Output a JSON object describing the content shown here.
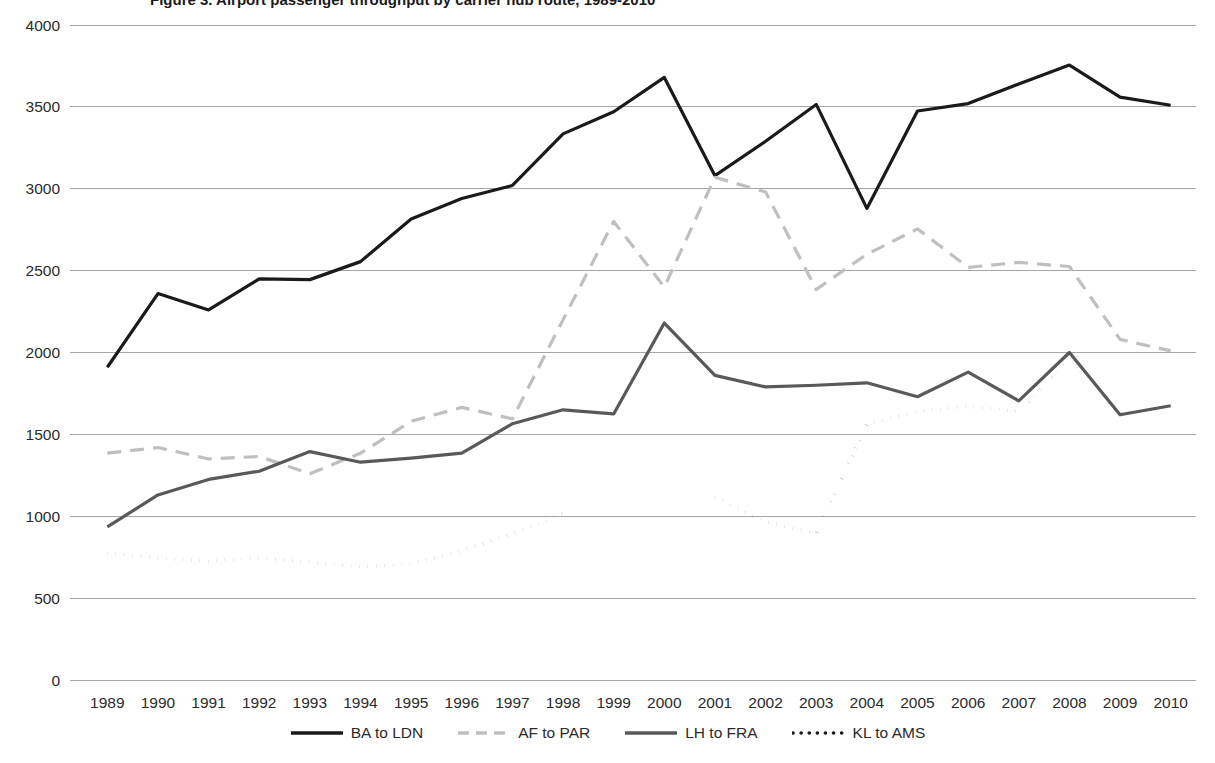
{
  "chart_title": "Figure 3. Airport passenger throughput by carrier hub route, 1989-2010",
  "legend": {
    "position": "bottom-center",
    "items": [
      {
        "label": "BA to LDN",
        "color": "#1a1a1a",
        "style": "solid",
        "width": 3.2,
        "swatch": "legend-swatch-solid-black"
      },
      {
        "label": "AF to PAR",
        "color": "#bfbfbf",
        "style": "dashed",
        "width": 3.2,
        "swatch": "legend-swatch-dashed-gray"
      },
      {
        "label": "LH to FRA",
        "color": "#595959",
        "style": "solid",
        "width": 3.2,
        "swatch": "legend-swatch-solid-gray"
      },
      {
        "label": "KL to AMS",
        "color": "#1a1a1a",
        "style": "dotted",
        "width": 3.4,
        "swatch": "legend-swatch-dotted-black"
      }
    ]
  },
  "axes": {
    "y_ticks": [
      "4000",
      "3500",
      "3000",
      "2500",
      "2000",
      "1500",
      "1000",
      "500",
      "0"
    ],
    "x_ticks": [
      "1989",
      "1990",
      "1991",
      "1992",
      "1993",
      "1994",
      "1995",
      "1996",
      "1997",
      "1998",
      "1999",
      "2000",
      "2001",
      "2002",
      "2003",
      "2004",
      "2005",
      "2006",
      "2007",
      "2008",
      "2009",
      "2010"
    ]
  },
  "chart_data": {
    "type": "line",
    "title": "Figure 3. Airport passenger throughput by carrier hub route, 1989-2010",
    "xlabel": "",
    "ylabel": "",
    "xlim": [
      1989,
      2010
    ],
    "ylim": [
      0,
      4000
    ],
    "ytick_step": 500,
    "grid": true,
    "legend_position": "bottom-center",
    "x": [
      1989,
      1990,
      1991,
      1992,
      1993,
      1994,
      1995,
      1996,
      1997,
      1998,
      1999,
      2000,
      2001,
      2002,
      2003,
      2004,
      2005,
      2006,
      2007,
      2008,
      2009,
      2010
    ],
    "series": [
      {
        "name": "BA to LDN",
        "color": "#1a1a1a",
        "style": "solid",
        "values": [
          1910,
          2360,
          2260,
          2450,
          2445,
          2555,
          2815,
          2940,
          3020,
          3335,
          3470,
          3680,
          3080,
          3290,
          3515,
          2880,
          3475,
          3520,
          3640,
          3755,
          3560,
          3510
        ]
      },
      {
        "name": "AF to PAR",
        "color": "#bfbfbf",
        "style": "dashed",
        "values": [
          1385,
          1420,
          1350,
          1365,
          1260,
          1385,
          1580,
          1665,
          1595,
          2200,
          2800,
          2400,
          3070,
          2980,
          2385,
          2600,
          2755,
          2520,
          2550,
          2525,
          2080,
          2010
        ]
      },
      {
        "name": "LH to FRA",
        "color": "#595959",
        "style": "solid",
        "values": [
          935,
          1130,
          1225,
          1275,
          1395,
          1330,
          1355,
          1385,
          1565,
          1650,
          1625,
          2180,
          1860,
          1790,
          1800,
          1815,
          1730,
          1880,
          1705,
          2000,
          1620,
          1675
        ]
      },
      {
        "name": "KL to AMS",
        "color": "#1a1a1a",
        "style": "dotted",
        "values": [
          775,
          745,
          725,
          745,
          720,
          690,
          710,
          790,
          890,
          1020,
          null,
          null,
          1115,
          965,
          895,
          1560,
          1640,
          1670,
          1640,
          1960,
          1625,
          1670
        ]
      }
    ]
  }
}
